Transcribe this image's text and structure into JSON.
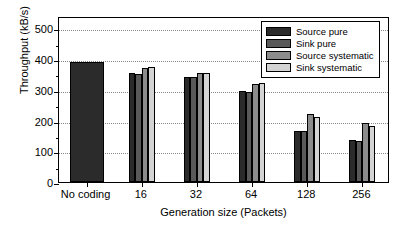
{
  "chart_data": {
    "type": "bar",
    "title": "",
    "xlabel": "Generation size (Packets)",
    "ylabel": "Throughput (kB/s)",
    "categories": [
      "No coding",
      "16",
      "32",
      "64",
      "128",
      "256"
    ],
    "series": [
      {
        "name": "Source pure",
        "color": "#2b2b2b",
        "values": [
          390,
          355,
          342,
          295,
          167,
          137
        ]
      },
      {
        "name": "Sink pure",
        "color": "#595959",
        "values": [
          null,
          352,
          340,
          292,
          165,
          135
        ]
      },
      {
        "name": "Source systematic",
        "color": "#8c8c8c",
        "values": [
          null,
          372,
          355,
          320,
          222,
          192
        ]
      },
      {
        "name": "Sink systematic",
        "color": "#d4d4d4",
        "values": [
          null,
          374,
          356,
          322,
          210,
          182
        ]
      }
    ],
    "ylim": [
      0,
      540
    ],
    "yticks": [
      0,
      100,
      200,
      300,
      400,
      500
    ],
    "ytick_labels": [
      "0",
      "100",
      "200",
      "300",
      "400",
      "500"
    ],
    "yminor_ticks": [
      50,
      150,
      250,
      350,
      450
    ],
    "grid": true,
    "grid_axis": "y",
    "legend_position": "top-right",
    "legend_entries": [
      "Source pure",
      "Sink pure",
      "Source systematic",
      "Sink systematic"
    ],
    "no_coding_single_bar": true
  }
}
